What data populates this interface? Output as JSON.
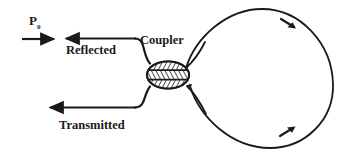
{
  "figure": {
    "type": "fiber-optic-ring-resonator-diagram",
    "background_color": "#ffffff",
    "stroke_color": "#1a1a1a",
    "labels": {
      "input_power": "P",
      "input_power_subscript": "0",
      "reflected": "Reflected",
      "coupler": "Coupler",
      "transmitted": "Transmitted"
    },
    "components": {
      "coupler_name": "coupler-ellipse",
      "loop_name": "fiber-loop",
      "input_port": "input-waveguide",
      "reflected_port": "reflected-waveguide",
      "transmitted_port": "transmitted-waveguide"
    },
    "flow_arrows": {
      "input_direction": "right",
      "reflected_direction": "left",
      "transmitted_direction": "left",
      "loop_top_direction": "clockwise-down-right",
      "loop_bottom_direction": "clockwise-up-right"
    }
  }
}
